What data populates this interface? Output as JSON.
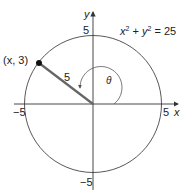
{
  "diagram": {
    "equation": {
      "base1": "x",
      "exp1": "2",
      "plus": " + ",
      "base2": "y",
      "exp2": "2",
      "eq": " = 25"
    },
    "axes": {
      "x_label": "x",
      "y_label": "y",
      "x_pos_tick": "5",
      "x_neg_tick": "−5",
      "y_pos_tick": "5",
      "y_neg_tick": "−5"
    },
    "point": {
      "label": "(x, 3)"
    },
    "radius_label": "5",
    "angle_label": "θ",
    "colors": {
      "line": "#333333",
      "radius": "#666666",
      "point": "#111111"
    }
  }
}
